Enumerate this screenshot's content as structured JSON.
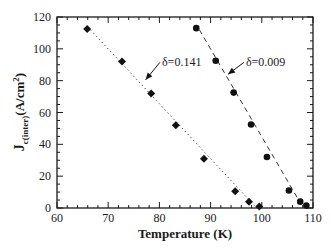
{
  "chart_data": {
    "type": "scatter",
    "title": "",
    "xlabel": "Temperature (K)",
    "ylabel": "J_c(inter) (A/cm^2)",
    "ylabel_main": "J",
    "ylabel_sub": "c(inter)",
    "ylabel_units": "(A/cm",
    "ylabel_sup": "2",
    "ylabel_close": ")",
    "xlim": [
      60,
      110
    ],
    "ylim": [
      0,
      120
    ],
    "xticks": [
      60,
      70,
      80,
      90,
      100,
      110
    ],
    "yticks": [
      0,
      20,
      40,
      60,
      80,
      100,
      120
    ],
    "x_minor_step": 2,
    "y_minor_step": 5,
    "grid": false,
    "legend": "none (inline annotations with arrows)",
    "series": [
      {
        "name": "δ=0.141",
        "marker": "diamond",
        "line_style": "dotted",
        "x": [
          65.9,
          72.7,
          78.4,
          83.2,
          88.7,
          94.8,
          97.5,
          99.5
        ],
        "y": [
          112.5,
          92,
          72,
          52,
          31,
          10.5,
          4,
          1
        ],
        "fit_line": {
          "x": [
            66.5,
            99.0
          ],
          "y": [
            112,
            0
          ]
        }
      },
      {
        "name": "δ=0.009",
        "marker": "circle",
        "line_style": "dashed",
        "x": [
          87.2,
          91.0,
          94.5,
          97.9,
          101.0,
          105.3,
          107.5,
          108.7
        ],
        "y": [
          113,
          92.5,
          72.5,
          52.5,
          32,
          11,
          4,
          1.5
        ],
        "fit_line": {
          "x": [
            87.8,
            107.2
          ],
          "y": [
            112,
            5
          ]
        }
      }
    ],
    "annotations": [
      {
        "text": "δ=0.141",
        "text_x": 80.5,
        "text_y": 89,
        "arrow_to_x": 77.3,
        "arrow_to_y": 80.5
      },
      {
        "text": "δ=0.009",
        "text_x": 96.9,
        "text_y": 89,
        "arrow_to_x": 93.4,
        "arrow_to_y": 84
      }
    ]
  }
}
